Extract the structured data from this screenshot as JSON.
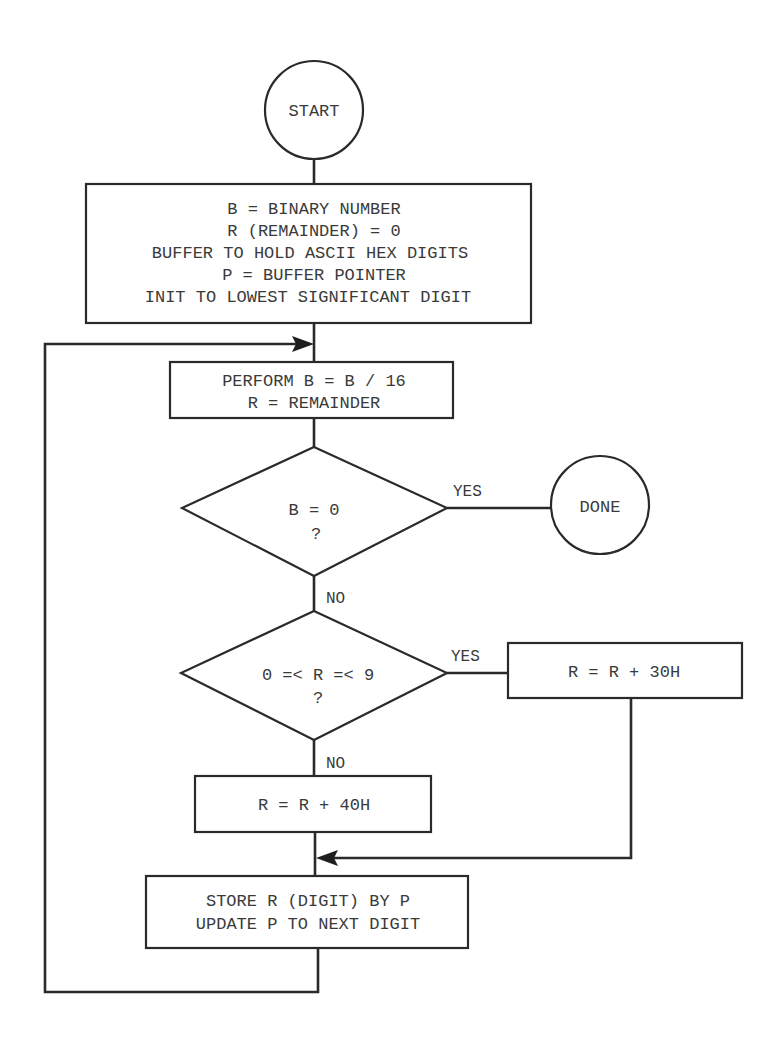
{
  "diagram": {
    "type": "flowchart",
    "colors": {
      "stroke": "#2a2a2a",
      "text": "#3a3a3a",
      "background": "#ffffff"
    },
    "nodes": {
      "start": {
        "shape": "circle",
        "label": "START"
      },
      "init": {
        "shape": "rectangle",
        "lines": [
          "B = BINARY NUMBER",
          "R (REMAINDER) = 0",
          "BUFFER TO HOLD ASCII HEX DIGITS",
          "P = BUFFER POINTER",
          "INIT TO LOWEST SIGNIFICANT DIGIT"
        ]
      },
      "divide": {
        "shape": "rectangle",
        "lines": [
          "PERFORM B = B / 16",
          "R = REMAINDER"
        ]
      },
      "check_b": {
        "shape": "diamond",
        "lines": [
          "B = 0",
          "?"
        ]
      },
      "done": {
        "shape": "circle",
        "label": "DONE"
      },
      "check_r": {
        "shape": "diamond",
        "lines": [
          "0 =< R =< 9",
          "?"
        ]
      },
      "add30": {
        "shape": "rectangle",
        "label": "R = R + 30H"
      },
      "add40": {
        "shape": "rectangle",
        "label": "R = R + 40H"
      },
      "store": {
        "shape": "rectangle",
        "lines": [
          "STORE R (DIGIT) BY P",
          "UPDATE P TO NEXT DIGIT"
        ]
      }
    },
    "edges": {
      "check_b_yes": "YES",
      "check_b_no": "NO",
      "check_r_yes": "YES",
      "check_r_no": "NO"
    },
    "edge_list": [
      {
        "from": "start",
        "to": "init"
      },
      {
        "from": "init",
        "to": "divide"
      },
      {
        "from": "divide",
        "to": "check_b"
      },
      {
        "from": "check_b",
        "to": "done",
        "label": "YES"
      },
      {
        "from": "check_b",
        "to": "check_r",
        "label": "NO"
      },
      {
        "from": "check_r",
        "to": "add30",
        "label": "YES"
      },
      {
        "from": "check_r",
        "to": "add40",
        "label": "NO"
      },
      {
        "from": "add30",
        "to": "store"
      },
      {
        "from": "add40",
        "to": "store"
      },
      {
        "from": "store",
        "to": "divide",
        "label": "loop"
      }
    ]
  }
}
